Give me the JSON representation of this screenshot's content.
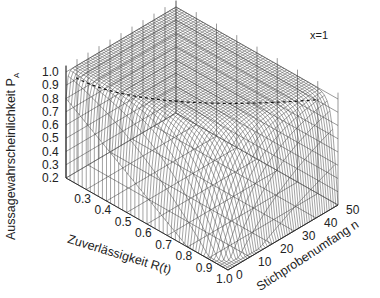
{
  "chart_data": {
    "type": "surface3d",
    "title": "",
    "annotation": "x=1",
    "xlabel": "Zuverlässigkeit R(t)",
    "ylabel": "Stichprobenumfang n",
    "zlabel": "Aussagewahrscheinlichkeit P",
    "zlabel_sub": "A",
    "x_ticks": [
      "0.3",
      "0.4",
      "0.5",
      "0.6",
      "0.7",
      "0.8",
      "0.9",
      "1.0"
    ],
    "y_ticks": [
      "0",
      "10",
      "20",
      "30",
      "40",
      "50"
    ],
    "z_ticks": [
      "0.2",
      "0.3",
      "0.4",
      "0.5",
      "0.6",
      "0.7",
      "0.8",
      "0.9",
      "1.0"
    ],
    "xlim": [
      0.2,
      1.0
    ],
    "ylim": [
      0,
      50
    ],
    "zlim": [
      0.2,
      1.0
    ],
    "formula": "P_A = 1 - R^(n+1) (x=1 failure)",
    "surface": {
      "x": [
        0.2,
        0.3,
        0.4,
        0.5,
        0.6,
        0.7,
        0.8,
        0.9,
        1.0
      ],
      "y": [
        0,
        10,
        20,
        30,
        40,
        50
      ],
      "note": "P_A near 1.0 for most of the domain; drops toward 0 as R -> 1.0 and n -> 0"
    },
    "grid": true,
    "style": "wireframe, grayscale"
  }
}
